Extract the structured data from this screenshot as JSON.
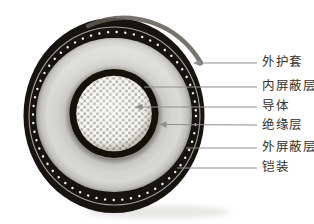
{
  "diagram": {
    "kind": "cable-cross-section",
    "background_color": "#ffffff",
    "colors": {
      "outer_sheath": "#17140f",
      "insulation": "#d4d4d0",
      "inner_shield": "#141109",
      "conductor_strand": "#f8f8f3",
      "armor_dot": "#f3f0e8",
      "leader_line": "#8f8f8f",
      "label_text": "#35312b"
    },
    "labels": [
      {
        "text": "外护套",
        "target": "outer-sheath"
      },
      {
        "text": "内屏蔽层",
        "target": "inner-shield"
      },
      {
        "text": "导体",
        "target": "conductor"
      },
      {
        "text": "绝缘层",
        "target": "insulation"
      },
      {
        "text": "外屏蔽层",
        "target": "outer-shield"
      },
      {
        "text": "铠装",
        "target": "armor"
      }
    ]
  }
}
